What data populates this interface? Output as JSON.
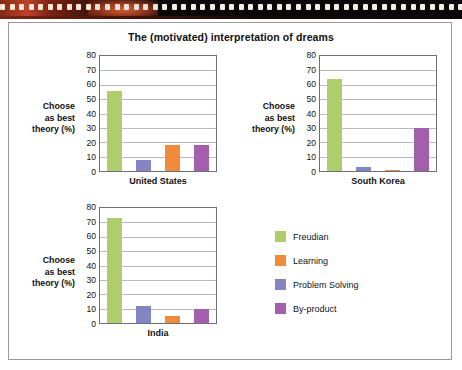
{
  "decor": {
    "film_strip_name": "film-strip-border"
  },
  "frame": {
    "title": "The (motivated) interpretation of dreams"
  },
  "axis_label_lines": [
    "Choose",
    "as best",
    "theory (%)"
  ],
  "y_ticks": [
    "80",
    "70",
    "60",
    "50",
    "40",
    "30",
    "20",
    "10",
    "0"
  ],
  "legend": {
    "items": [
      {
        "label": "Freudian",
        "color": "#AECE6B"
      },
      {
        "label": "Learning",
        "color": "#F08B3C"
      },
      {
        "label": "Problem Solving",
        "color": "#8285C1"
      },
      {
        "label": "By-product",
        "color": "#A35FAC"
      }
    ]
  },
  "chart_data": {
    "type": "bar",
    "title": "The (motivated) interpretation of dreams",
    "xlabel": "",
    "ylabel": "Choose as best theory (%)",
    "ylim": [
      0,
      80
    ],
    "ytick_step": 10,
    "grid": true,
    "legend_position": "bottom-right",
    "panel_layout": "3 small-multiple panels: United States, South Korea, India",
    "bar_order": [
      "Freudian",
      "Problem Solving",
      "Learning",
      "By-product"
    ],
    "categories": [
      "United States",
      "South Korea",
      "India"
    ],
    "series": [
      {
        "name": "Freudian",
        "color": "#AECE6B",
        "values": [
          56,
          64,
          73
        ]
      },
      {
        "name": "Learning",
        "color": "#F08B3C",
        "values": [
          18,
          0.7,
          5
        ]
      },
      {
        "name": "Problem Solving",
        "color": "#8285C1",
        "values": [
          8,
          2.5,
          12
        ]
      },
      {
        "name": "By-product",
        "color": "#A35FAC",
        "values": [
          18,
          30,
          10
        ]
      }
    ],
    "panels": [
      {
        "name": "United States",
        "bars": [
          {
            "label": "Freudian",
            "value": 56,
            "color": "#AECE6B"
          },
          {
            "label": "Problem Solving",
            "value": 8,
            "color": "#8285C1"
          },
          {
            "label": "Learning",
            "value": 18,
            "color": "#F08B3C"
          },
          {
            "label": "By-product",
            "value": 18,
            "color": "#A35FAC"
          }
        ]
      },
      {
        "name": "South Korea",
        "bars": [
          {
            "label": "Freudian",
            "value": 64,
            "color": "#AECE6B"
          },
          {
            "label": "Problem Solving",
            "value": 2.5,
            "color": "#8285C1"
          },
          {
            "label": "Learning",
            "value": 0.7,
            "color": "#F08B3C"
          },
          {
            "label": "By-product",
            "value": 30,
            "color": "#A35FAC"
          }
        ]
      },
      {
        "name": "India",
        "bars": [
          {
            "label": "Freudian",
            "value": 73,
            "color": "#AECE6B"
          },
          {
            "label": "Problem Solving",
            "value": 12,
            "color": "#8285C1"
          },
          {
            "label": "Learning",
            "value": 5,
            "color": "#F08B3C"
          },
          {
            "label": "By-product",
            "value": 10,
            "color": "#A35FAC"
          }
        ]
      }
    ]
  }
}
